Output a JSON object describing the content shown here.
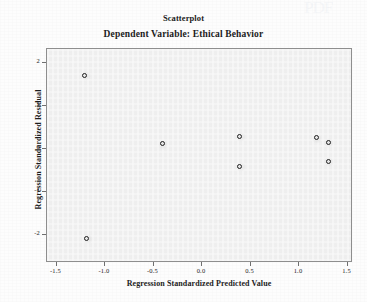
{
  "chart_data": {
    "type": "scatter",
    "title": "Scatterplot",
    "subtitle": "Dependent Variable: Ethical Behavior",
    "xlabel": "Regression Standardized Predicted Value",
    "ylabel": "Regression Standardized Residual",
    "xlim": [
      -1.75,
      1.8
    ],
    "ylim": [
      -2.3,
      2.15
    ],
    "xticks": [
      -1.5,
      -1.0,
      -0.5,
      0.0,
      0.5,
      1.0,
      1.5
    ],
    "xticklabels": [
      "-1.5",
      "-1.0",
      "-0.5",
      "0.0",
      "0.5",
      "1.0",
      "1.5"
    ],
    "yticks": [
      2,
      1,
      0,
      -1,
      -2
    ],
    "yticklabels": [
      "2",
      "1",
      "0",
      "-1",
      "-2"
    ],
    "grid": false,
    "legend": false,
    "marker": "open-circle",
    "points": [
      {
        "x": -1.21,
        "y": 1.72
      },
      {
        "x": -1.19,
        "y": -2.07
      },
      {
        "x": -0.41,
        "y": 0.12
      },
      {
        "x": 0.39,
        "y": 0.3
      },
      {
        "x": 0.39,
        "y": -0.4
      },
      {
        "x": 1.18,
        "y": 0.26
      },
      {
        "x": 1.3,
        "y": 0.16
      },
      {
        "x": 1.3,
        "y": -0.28
      }
    ]
  },
  "watermark": {
    "text": "PDF"
  }
}
